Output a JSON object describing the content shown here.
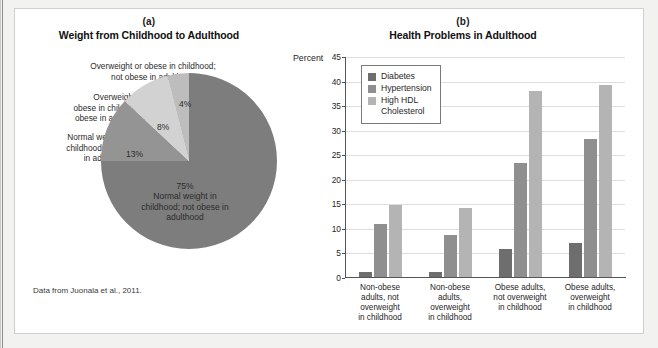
{
  "figure": {
    "source_note": "Data from Juonala et al., 2011."
  },
  "panel_a": {
    "letter": "(a)",
    "title": "Weight from Childhood to Adulthood",
    "callouts": {
      "top": "Overweight or obese in childhood;\nnot obese in adulthood",
      "upper_left": "Overweight or\nobese in childhood;\nobese in adulthood",
      "lower_left": "Normal weight in\nchildhood; obese\nin adulthood"
    },
    "slice_labels": {
      "s75_pct": "75%",
      "s75_desc": "Normal weight in\nchildhood; not obese in\nadulthood",
      "s13": "13%",
      "s8": "8%",
      "s4": "4%"
    }
  },
  "panel_b": {
    "letter": "(b)",
    "title": "Health Problems in Adulthood",
    "percent_axis_label": "Percent"
  },
  "chart_data": [
    {
      "type": "pie",
      "title": "Weight from Childhood to Adulthood",
      "panel": "(a)",
      "slices": [
        {
          "label": "Normal weight in childhood; not obese in adulthood",
          "value": 75,
          "display": "75%",
          "color": "#7d7d7d"
        },
        {
          "label": "Normal weight in childhood; obese in adulthood",
          "value": 13,
          "display": "13%",
          "color": "#949494"
        },
        {
          "label": "Overweight or obese in childhood; obese in adulthood",
          "value": 8,
          "display": "8%",
          "color": "#d2d2d2"
        },
        {
          "label": "Overweight or obese in childhood; not obese in adulthood",
          "value": 4,
          "display": "4%",
          "color": "#bdbdbd"
        }
      ],
      "legend": "none",
      "source": "Data from Juonala et al., 2011."
    },
    {
      "type": "bar",
      "panel": "(b)",
      "title": "Health Problems in Adulthood",
      "xlabel": "",
      "ylabel": "Percent",
      "ylim": [
        0,
        45
      ],
      "yticks": [
        0,
        5,
        10,
        15,
        20,
        25,
        30,
        35,
        40,
        45
      ],
      "grid": true,
      "legend_position": "inside-top-left",
      "categories": [
        "Non-obese\nadults, not\noverweight\nin childhood",
        "Non-obese\nadults,\noverweight\nin childhood",
        "Obese adults,\nnot overweight\nin childhood",
        "Obese adults,\noverweight\nin childhood"
      ],
      "series": [
        {
          "name": "Diabetes",
          "color": "#6e6e6e",
          "values": [
            1.2,
            1.3,
            6.0,
            7.2
          ]
        },
        {
          "name": "Hypertension",
          "color": "#8f8f8f",
          "values": [
            11.0,
            8.8,
            23.5,
            28.4
          ]
        },
        {
          "name": "High HDL\nCholesterol",
          "color": "#b4b4b4",
          "values": [
            14.9,
            14.2,
            38.0,
            39.4
          ]
        }
      ]
    }
  ]
}
